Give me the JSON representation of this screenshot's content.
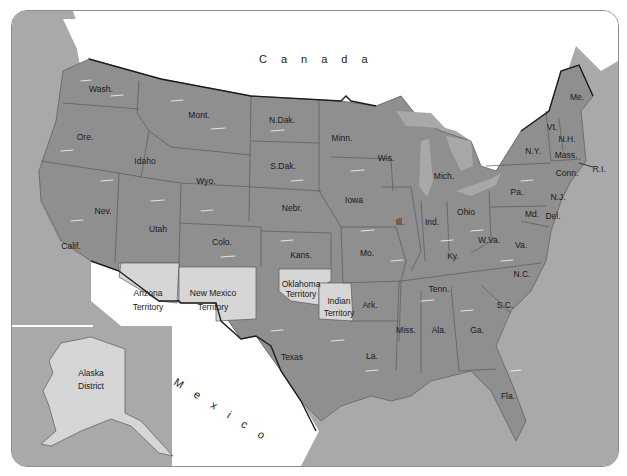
{
  "map": {
    "colors": {
      "land_states": "#8f8f8f",
      "territories": "#d6d6d6",
      "water": "#a9a9a9",
      "foreign_land": "#ffffff",
      "border": "#1e1e1e",
      "frame": "#8c8c8c"
    },
    "countries": {
      "canada": "Canada",
      "mexico": "Mexico"
    },
    "states": [
      {
        "id": "wash",
        "label": "Wash.",
        "x": 100,
        "y": 88
      },
      {
        "id": "ore",
        "label": "Ore.",
        "x": 84,
        "y": 136
      },
      {
        "id": "calif",
        "label": "Calif.",
        "x": 70,
        "y": 245
      },
      {
        "id": "idaho",
        "label": "Idaho",
        "x": 144,
        "y": 160
      },
      {
        "id": "nev",
        "label": "Nev.",
        "x": 102,
        "y": 210
      },
      {
        "id": "mont",
        "label": "Mont.",
        "x": 198,
        "y": 114
      },
      {
        "id": "wyo",
        "label": "Wyo.",
        "x": 205,
        "y": 180
      },
      {
        "id": "utah",
        "label": "Utah",
        "x": 157,
        "y": 228
      },
      {
        "id": "colo",
        "label": "Colo.",
        "x": 221,
        "y": 241
      },
      {
        "id": "ndak",
        "label": "N.Dak.",
        "x": 281,
        "y": 119
      },
      {
        "id": "sdak",
        "label": "S.Dak.",
        "x": 282,
        "y": 165
      },
      {
        "id": "nebr",
        "label": "Nebr.",
        "x": 291,
        "y": 207
      },
      {
        "id": "kans",
        "label": "Kans.",
        "x": 300,
        "y": 254
      },
      {
        "id": "texas",
        "label": "Texas",
        "x": 291,
        "y": 356
      },
      {
        "id": "minn",
        "label": "Minn.",
        "x": 341,
        "y": 137
      },
      {
        "id": "iowa",
        "label": "Iowa",
        "x": 353,
        "y": 199
      },
      {
        "id": "mo",
        "label": "Mo.",
        "x": 366,
        "y": 252
      },
      {
        "id": "ark",
        "label": "Ark.",
        "x": 369,
        "y": 304
      },
      {
        "id": "la",
        "label": "La.",
        "x": 371,
        "y": 355
      },
      {
        "id": "wis",
        "label": "Wis.",
        "x": 385,
        "y": 157
      },
      {
        "id": "ill",
        "label": "Ill.",
        "x": 399,
        "y": 221
      },
      {
        "id": "mich",
        "label": "Mich.",
        "x": 443,
        "y": 175
      },
      {
        "id": "ind",
        "label": "Ind.",
        "x": 431,
        "y": 221
      },
      {
        "id": "ohio",
        "label": "Ohio",
        "x": 465,
        "y": 211
      },
      {
        "id": "ky",
        "label": "Ky.",
        "x": 452,
        "y": 255
      },
      {
        "id": "tenn",
        "label": "Tenn.",
        "x": 438,
        "y": 288
      },
      {
        "id": "miss",
        "label": "Miss.",
        "x": 405,
        "y": 329
      },
      {
        "id": "ala",
        "label": "Ala.",
        "x": 438,
        "y": 329
      },
      {
        "id": "ga",
        "label": "Ga.",
        "x": 476,
        "y": 329
      },
      {
        "id": "fla",
        "label": "Fla.",
        "x": 507,
        "y": 395
      },
      {
        "id": "sc",
        "label": "S.C.",
        "x": 504,
        "y": 304
      },
      {
        "id": "nc",
        "label": "N.C.",
        "x": 521,
        "y": 273
      },
      {
        "id": "va",
        "label": "Va.",
        "x": 520,
        "y": 244
      },
      {
        "id": "wva",
        "label": "W.Va.",
        "x": 488,
        "y": 239
      },
      {
        "id": "md",
        "label": "Md.",
        "x": 531,
        "y": 213
      },
      {
        "id": "del",
        "label": "Del.",
        "x": 552,
        "y": 215
      },
      {
        "id": "pa",
        "label": "Pa.",
        "x": 516,
        "y": 191
      },
      {
        "id": "nj",
        "label": "N.J.",
        "x": 557,
        "y": 196
      },
      {
        "id": "ny",
        "label": "N.Y.",
        "x": 532,
        "y": 150
      },
      {
        "id": "vt",
        "label": "Vt.",
        "x": 551,
        "y": 126
      },
      {
        "id": "nh",
        "label": "N.H.",
        "x": 566,
        "y": 138
      },
      {
        "id": "mass",
        "label": "Mass.",
        "x": 565,
        "y": 154
      },
      {
        "id": "conn",
        "label": "Conn.",
        "x": 566,
        "y": 172
      },
      {
        "id": "ri",
        "label": "R.I.",
        "x": 596,
        "y": 168
      },
      {
        "id": "me",
        "label": "Me.",
        "x": 576,
        "y": 96
      }
    ],
    "territories": [
      {
        "id": "arizona",
        "line1": "Arizona",
        "line2": "Territory",
        "x": 147,
        "y": 294
      },
      {
        "id": "new_mexico",
        "line1": "New Mexico",
        "line2": "Territory",
        "x": 212,
        "y": 294
      },
      {
        "id": "oklahoma",
        "line1": "Oklahoma",
        "line2": "Territory",
        "x": 300,
        "y": 286
      },
      {
        "id": "indian",
        "line1": "Indian",
        "line2": "Territory",
        "x": 338,
        "y": 303
      },
      {
        "id": "alaska",
        "line1": "Alaska",
        "line2": "District",
        "x": 90,
        "y": 373
      }
    ]
  }
}
